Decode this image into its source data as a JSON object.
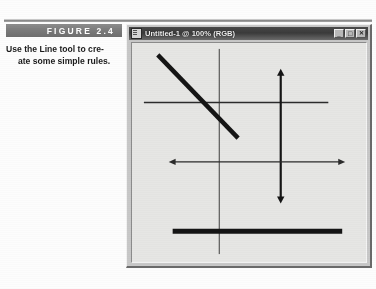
{
  "figure": {
    "label": "FIGURE 2.4",
    "caption_line_1": "Use the Line tool to cre-",
    "caption_line_2": "ate some simple rules.",
    "band_color": "#7a7a7a",
    "label_color": "#ffffff"
  },
  "window": {
    "title": "Untitled-1 @ 100% (RGB)",
    "title_icon": "document-icon",
    "titlebar_color": "#3a3a3a",
    "chrome_color": "#c8c8c8",
    "controls": [
      {
        "name": "minimize",
        "glyph": "_"
      },
      {
        "name": "maximize",
        "glyph": "□"
      },
      {
        "name": "close",
        "glyph": "✕"
      }
    ]
  },
  "canvas": {
    "background_color": "#e6e6e4",
    "stroke_color": "#1a1a1a",
    "width": 236,
    "height": 221
  },
  "chart_data": {
    "type": "diagram",
    "title": "Untitled-1 @ 100% (RGB)",
    "xlabel": "",
    "ylabel": "",
    "grid": false,
    "legend": null,
    "shapes": [
      {
        "name": "thin-vertical-rule",
        "kind": "line",
        "x1": 88,
        "y1": 6,
        "x2": 88,
        "y2": 213,
        "width": 1,
        "arrow_start": false,
        "arrow_end": false,
        "color": "#3c3c3c"
      },
      {
        "name": "thin-horizontal-rule",
        "kind": "line",
        "x1": 12,
        "y1": 60,
        "x2": 198,
        "y2": 60,
        "width": 1.6,
        "arrow_start": false,
        "arrow_end": false,
        "color": "#2b2b2b"
      },
      {
        "name": "thick-diagonal-rule",
        "kind": "line",
        "x1": 26,
        "y1": 12,
        "x2": 107,
        "y2": 96,
        "width": 4.5,
        "arrow_start": false,
        "arrow_end": false,
        "color": "#151515"
      },
      {
        "name": "vertical-double-arrow-rule",
        "kind": "line",
        "x1": 150,
        "y1": 26,
        "x2": 150,
        "y2": 162,
        "width": 2.2,
        "arrow_start": true,
        "arrow_end": true,
        "color": "#151515"
      },
      {
        "name": "horizontal-double-arrow-rule",
        "kind": "line",
        "x1": 37,
        "y1": 120,
        "x2": 215,
        "y2": 120,
        "width": 1.2,
        "arrow_start": true,
        "arrow_end": true,
        "color": "#2b2b2b"
      },
      {
        "name": "thick-horizontal-bar-rule",
        "kind": "line",
        "x1": 41,
        "y1": 190,
        "x2": 212,
        "y2": 190,
        "width": 5,
        "arrow_start": false,
        "arrow_end": false,
        "color": "#151515"
      }
    ]
  }
}
